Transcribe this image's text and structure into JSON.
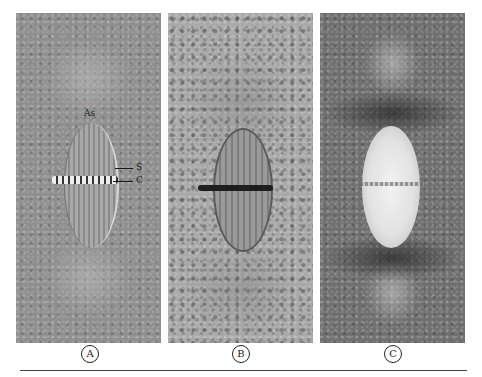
{
  "figure": {
    "panels": [
      {
        "id": "A",
        "label": "A",
        "description": "DIC micrograph of metaphase mitotic spindle with asters",
        "annotations": [
          {
            "key": "aster",
            "text": "As"
          },
          {
            "key": "spindle",
            "text": "S"
          },
          {
            "key": "chromosomes",
            "text": "C"
          }
        ]
      },
      {
        "id": "B",
        "label": "B",
        "description": "Phase-contrast micrograph of metaphase mitotic spindle"
      },
      {
        "id": "C",
        "label": "C",
        "description": "Polarized-light micrograph showing birefringent spindle"
      }
    ],
    "colors": {
      "background": "#ffffff",
      "panel_a_bg": "#8e8e8e",
      "panel_b_bg": "#a9a9a9",
      "panel_c_bg": "#6f6f6f",
      "text": "#222222"
    }
  }
}
